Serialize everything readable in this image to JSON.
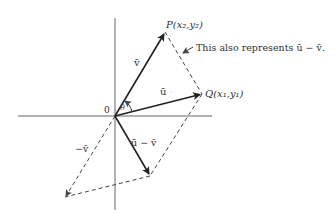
{
  "diagram": {
    "type": "vector-diagram",
    "colors": {
      "line": "#222222",
      "axis": "#555555",
      "dashed": "#444444",
      "text": "#333333"
    },
    "origin": {
      "label": "0",
      "x": 115,
      "y": 116
    },
    "axes": {
      "horizontal": {
        "x1": 18,
        "x2": 212,
        "y": 116
      },
      "vertical": {
        "x": 115,
        "y1": 18,
        "y2": 210
      }
    },
    "points": {
      "P": {
        "name": "P",
        "coords": "(x₂,y₂)",
        "x": 165,
        "y": 32
      },
      "Q": {
        "name": "Q",
        "coords": "(x₁,y₁)",
        "x": 202,
        "y": 94
      },
      "u_minus_v_tip": {
        "x": 150,
        "y": 176
      },
      "neg_v_tip": {
        "x": 65,
        "y": 197
      }
    },
    "vectors": [
      {
        "id": "v",
        "label": "v̄",
        "from": "origin",
        "to": "P",
        "style": "solid"
      },
      {
        "id": "u",
        "label": "ū",
        "from": "origin",
        "to": "Q",
        "style": "solid"
      },
      {
        "id": "u_minus_v",
        "label": "ū − v̄",
        "from": "origin",
        "to": "u_minus_v_tip",
        "style": "solid"
      },
      {
        "id": "neg_v",
        "label": "−v̄",
        "from": "origin",
        "to": "neg_v_tip",
        "style": "dashed"
      }
    ],
    "angle_label": "θ",
    "annotation": "This also represents ū − v̄.",
    "labels": {
      "P_label": "P(x₂,y₂)",
      "Q_label": "Q(x₁,y₁)",
      "v_label": "v̄",
      "u_label": "ū",
      "u_minus_v_label": "ū − v̄",
      "neg_v_label": "−v̄",
      "theta": "θ",
      "origin": "0"
    }
  }
}
